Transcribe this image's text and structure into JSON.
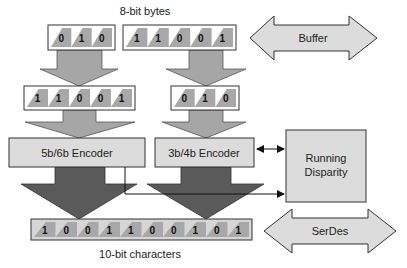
{
  "title_top": "8-bit bytes",
  "title_bottom": "10-bit characters",
  "colors": {
    "box_fill": "#dcdcdc",
    "cell_shade": "#a8a8a8",
    "arrow_light": "#a6a6a6",
    "arrow_dark": "#5a5a5a",
    "stroke": "#333333"
  },
  "input_bytes": {
    "left": [
      "0",
      "1",
      "0"
    ],
    "right": [
      "1",
      "1",
      "0",
      "0",
      "1"
    ]
  },
  "split_bytes": {
    "left": [
      "1",
      "1",
      "0",
      "0",
      "1"
    ],
    "right": [
      "0",
      "1",
      "0"
    ]
  },
  "encoders": {
    "five_six": "5b/6b Encoder",
    "three_four": "3b/4b Encoder"
  },
  "running_disparity": [
    "Running",
    "Disparity"
  ],
  "output_bits": [
    "1",
    "0",
    "0",
    "1",
    "1",
    "0",
    "0",
    "1",
    "0",
    "1"
  ],
  "buffer_label": "Buffer",
  "serdes_label": "SerDes"
}
